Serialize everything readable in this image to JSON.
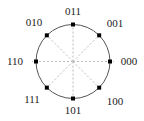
{
  "diagram": {
    "type": "constellation",
    "title": "",
    "center": {
      "x": 73,
      "y": 61.5
    },
    "radius": 37,
    "colors": {
      "circle": "#555555",
      "axes": "#bbbbbb",
      "points": "#000000",
      "labels": "#222222"
    },
    "points": [
      {
        "label": "000",
        "angle_deg": 0,
        "label_x": 129,
        "label_y": 65
      },
      {
        "label": "001",
        "angle_deg": 45,
        "label_x": 115,
        "label_y": 27
      },
      {
        "label": "011",
        "angle_deg": 90,
        "label_x": 73,
        "label_y": 15
      },
      {
        "label": "010",
        "angle_deg": 135,
        "label_x": 34,
        "label_y": 26
      },
      {
        "label": "110",
        "angle_deg": 180,
        "label_x": 15,
        "label_y": 65
      },
      {
        "label": "111",
        "angle_deg": 225,
        "label_x": 32,
        "label_y": 103
      },
      {
        "label": "101",
        "angle_deg": 270,
        "label_x": 73,
        "label_y": 114
      },
      {
        "label": "100",
        "angle_deg": 315,
        "label_x": 115,
        "label_y": 105
      }
    ]
  }
}
